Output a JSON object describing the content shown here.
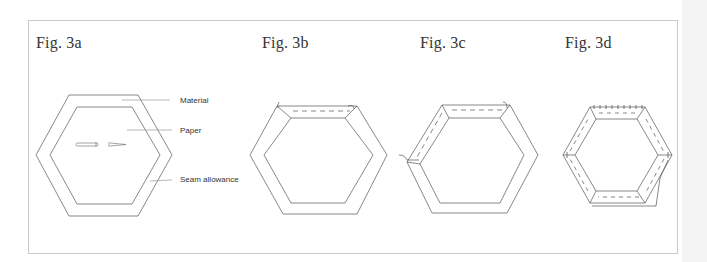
{
  "figures": [
    {
      "id": "3a",
      "title": "Fig. 3a"
    },
    {
      "id": "3b",
      "title": "Fig. 3b"
    },
    {
      "id": "3c",
      "title": "Fig. 3c"
    },
    {
      "id": "3d",
      "title": "Fig. 3d"
    }
  ],
  "callouts": {
    "material": "Material",
    "paper": "Paper",
    "seam_allowance": "Seam allowance"
  },
  "colors": {
    "line": "#555555",
    "border": "#c9c9c9",
    "margin": "#f3f3f3"
  }
}
